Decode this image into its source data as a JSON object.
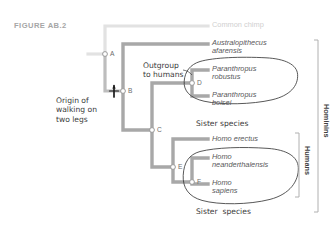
{
  "figure": {
    "number_label": "FIGURE AB.2"
  },
  "colors": {
    "branch": "#a8a8a8",
    "branch_faint": "#e2e2e2",
    "taxon_text": "#58585a",
    "taxon_faint_text": "#cfcfcf",
    "hand_text": "#3b3b3b",
    "node_stroke": "#9a9a9a",
    "circle_outline": "#3a3a3a",
    "bracket": "#b0b0b0",
    "caption": "#a6a6a6",
    "marker": "#1b1b1b",
    "background": "#ffffff"
  },
  "taxa": [
    {
      "id": "chimp",
      "name": "Common chimp",
      "style": "faint",
      "x": 212,
      "y": 26
    },
    {
      "id": "au-afarensis",
      "name": "Australopithecus\nafarensis",
      "style": "normal",
      "x": 212,
      "y": 44
    },
    {
      "id": "pa-robustus",
      "name": "Paranthropus\nrobustus",
      "style": "normal",
      "x": 212,
      "y": 70
    },
    {
      "id": "pa-boisei",
      "name": "Paranthropus\nboisei",
      "style": "normal",
      "x": 212,
      "y": 96
    },
    {
      "id": "homo-erectus",
      "name": "Homo erectus",
      "style": "normal",
      "x": 212,
      "y": 139
    },
    {
      "id": "homo-neander",
      "name": "Homo\nneanderthalensis",
      "style": "normal",
      "x": 212,
      "y": 158
    },
    {
      "id": "homo-sapiens",
      "name": "Homo\nsapiens",
      "style": "normal",
      "x": 212,
      "y": 184
    }
  ],
  "nodes": [
    {
      "id": "A",
      "label": "A",
      "x": 105,
      "y": 54
    },
    {
      "id": "B",
      "label": "B",
      "x": 123,
      "y": 91
    },
    {
      "id": "C",
      "label": "C",
      "x": 152,
      "y": 130
    },
    {
      "id": "D",
      "label": "D",
      "x": 192,
      "y": 83
    },
    {
      "id": "E",
      "label": "E",
      "x": 173,
      "y": 167
    },
    {
      "id": "F",
      "label": "F",
      "x": 192,
      "y": 182
    }
  ],
  "annotations": [
    {
      "id": "origin-bipedalism",
      "text": "Origin of\nwalking on\ntwo legs",
      "x": 56,
      "y": 96
    },
    {
      "id": "outgroup-to-humans",
      "text": "Outgroup\nto humans",
      "x": 143,
      "y": 61
    },
    {
      "id": "sister-species-paranthropus",
      "text": "Sister species",
      "x": 196,
      "y": 119
    },
    {
      "id": "sister-species-homo",
      "text": "Sister  species",
      "x": 196,
      "y": 207
    }
  ],
  "group_brackets": [
    {
      "id": "hominins",
      "label": "Hominins",
      "x": 318,
      "top": 40,
      "bottom": 212
    },
    {
      "id": "humans",
      "label": "Humans",
      "x": 299,
      "top": 133,
      "bottom": 197
    }
  ],
  "circles": [
    {
      "id": "paranthropus-clade-circle",
      "cx": 243,
      "cy": 83,
      "rx": 56,
      "ry": 23
    },
    {
      "id": "homo-clade-circle",
      "cx": 243,
      "cy": 176,
      "rx": 56,
      "ry": 26
    }
  ],
  "marker": {
    "id": "bipedalism-tick",
    "label": "",
    "x": 114,
    "y": 91
  }
}
